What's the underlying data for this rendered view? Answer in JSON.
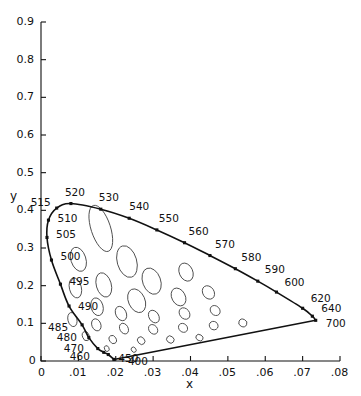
{
  "figure": {
    "title": "",
    "background_color": "#ffffff",
    "line_color": "#111111",
    "ellipse_color": "#444444"
  },
  "chart_data": {
    "type": "scatter",
    "title": "",
    "subtitle": "",
    "xlabel": "x",
    "ylabel": "y",
    "xlim": [
      0,
      0.08
    ],
    "ylim": [
      0,
      0.9
    ],
    "grid": false,
    "legend": null,
    "x_tick_values": [
      0,
      0.01,
      0.02,
      0.03,
      0.04,
      0.05,
      0.06,
      0.07,
      0.08
    ],
    "x_tick_labels": [
      "0",
      ".01",
      ".02",
      ".03",
      ".04",
      ".05",
      ".06",
      ".07",
      ".08"
    ],
    "y_tick_values": [
      0,
      0.1,
      0.2,
      0.3,
      0.4,
      0.5,
      0.6,
      0.7,
      0.8,
      0.9
    ],
    "y_tick_labels": [
      "0",
      "0.1",
      "0.2",
      "0.3",
      "0.4",
      "0.5",
      "0.6",
      "0.7",
      "0.8",
      "0.9"
    ],
    "annotations": [
      "MacAdam ellipses plotted on the spectral locus horseshoe",
      "Purple line closes the locus from 400 nm to 700 nm"
    ],
    "spectral_locus": {
      "name": "spectral locus",
      "marker": "filled-square",
      "points": [
        {
          "label": "400",
          "x": 0.0195,
          "y": 0.0042,
          "show_label": true,
          "label_dx": 14,
          "label_dy": 2
        },
        {
          "label": "450",
          "x": 0.018,
          "y": 0.0172,
          "show_label": true,
          "label_dx": 10,
          "label_dy": 3
        },
        {
          "label": "460",
          "x": 0.0168,
          "y": 0.023,
          "show_label": true,
          "label_dx": -34,
          "label_dy": 4
        },
        {
          "label": "470",
          "x": 0.0152,
          "y": 0.033,
          "show_label": true,
          "label_dx": -34,
          "label_dy": -1
        },
        {
          "label": "480",
          "x": 0.0128,
          "y": 0.062,
          "show_label": true,
          "label_dx": -32,
          "label_dy": -1
        },
        {
          "label": "485",
          "x": 0.011,
          "y": 0.096,
          "show_label": true,
          "label_dx": -34,
          "label_dy": 2
        },
        {
          "label": "490",
          "x": 0.0075,
          "y": 0.146,
          "show_label": true,
          "label_dx": 9,
          "label_dy": 0
        },
        {
          "label": "495",
          "x": 0.0052,
          "y": 0.204,
          "show_label": true,
          "label_dx": 9,
          "label_dy": -3
        },
        {
          "label": "500",
          "x": 0.0028,
          "y": 0.268,
          "show_label": true,
          "label_dx": 9,
          "label_dy": -4
        },
        {
          "label": "505",
          "x": 0.0016,
          "y": 0.328,
          "show_label": true,
          "label_dx": 9,
          "label_dy": -3
        },
        {
          "label": "510",
          "x": 0.002,
          "y": 0.374,
          "show_label": true,
          "label_dx": 9,
          "label_dy": -2
        },
        {
          "label": "515",
          "x": 0.0042,
          "y": 0.406,
          "show_label": true,
          "label_dx": -26,
          "label_dy": -6
        },
        {
          "label": "520",
          "x": 0.008,
          "y": 0.418,
          "show_label": true,
          "label_dx": -6,
          "label_dy": -12
        },
        {
          "label": "530",
          "x": 0.016,
          "y": 0.403,
          "show_label": true,
          "label_dx": -2,
          "label_dy": -12
        },
        {
          "label": "540",
          "x": 0.0236,
          "y": 0.379,
          "show_label": true,
          "label_dx": 0,
          "label_dy": -12
        },
        {
          "label": "550",
          "x": 0.031,
          "y": 0.348,
          "show_label": true,
          "label_dx": 2,
          "label_dy": -12
        },
        {
          "label": "560",
          "x": 0.0384,
          "y": 0.314,
          "show_label": true,
          "label_dx": 4,
          "label_dy": -12
        },
        {
          "label": "570",
          "x": 0.0452,
          "y": 0.28,
          "show_label": true,
          "label_dx": 5,
          "label_dy": -12
        },
        {
          "label": "580",
          "x": 0.052,
          "y": 0.245,
          "show_label": true,
          "label_dx": 6,
          "label_dy": -12
        },
        {
          "label": "590",
          "x": 0.058,
          "y": 0.212,
          "show_label": true,
          "label_dx": 7,
          "label_dy": -12
        },
        {
          "label": "600",
          "x": 0.063,
          "y": 0.183,
          "show_label": true,
          "label_dx": 8,
          "label_dy": -10
        },
        {
          "label": "620",
          "x": 0.07,
          "y": 0.14,
          "show_label": true,
          "label_dx": 8,
          "label_dy": -10
        },
        {
          "label": "640",
          "x": 0.0726,
          "y": 0.119,
          "show_label": true,
          "label_dx": 9,
          "label_dy": -8
        },
        {
          "label": "700",
          "x": 0.0735,
          "y": 0.108,
          "show_label": true,
          "label_dx": 10,
          "label_dy": 3
        }
      ]
    },
    "ellipses": [
      {
        "cx": 0.016,
        "cy": 0.352,
        "rx": 0.0026,
        "ry": 0.064,
        "angle": -18
      },
      {
        "cx": 0.01,
        "cy": 0.27,
        "rx": 0.002,
        "ry": 0.033,
        "angle": -18
      },
      {
        "cx": 0.023,
        "cy": 0.264,
        "rx": 0.0026,
        "ry": 0.043,
        "angle": -16
      },
      {
        "cx": 0.0168,
        "cy": 0.202,
        "rx": 0.002,
        "ry": 0.033,
        "angle": -16
      },
      {
        "cx": 0.0296,
        "cy": 0.212,
        "rx": 0.0024,
        "ry": 0.036,
        "angle": -20
      },
      {
        "cx": 0.0388,
        "cy": 0.236,
        "rx": 0.0018,
        "ry": 0.025,
        "angle": -24
      },
      {
        "cx": 0.0092,
        "cy": 0.194,
        "rx": 0.0016,
        "ry": 0.027,
        "angle": -14
      },
      {
        "cx": 0.0256,
        "cy": 0.16,
        "rx": 0.0022,
        "ry": 0.033,
        "angle": -24
      },
      {
        "cx": 0.0368,
        "cy": 0.17,
        "rx": 0.0018,
        "ry": 0.025,
        "angle": -28
      },
      {
        "cx": 0.0448,
        "cy": 0.182,
        "rx": 0.0015,
        "ry": 0.019,
        "angle": -34
      },
      {
        "cx": 0.015,
        "cy": 0.144,
        "rx": 0.0016,
        "ry": 0.024,
        "angle": -16
      },
      {
        "cx": 0.0214,
        "cy": 0.126,
        "rx": 0.0014,
        "ry": 0.02,
        "angle": -26
      },
      {
        "cx": 0.0302,
        "cy": 0.118,
        "rx": 0.0013,
        "ry": 0.018,
        "angle": -32
      },
      {
        "cx": 0.0384,
        "cy": 0.126,
        "rx": 0.0013,
        "ry": 0.0165,
        "angle": -38
      },
      {
        "cx": 0.0466,
        "cy": 0.134,
        "rx": 0.0012,
        "ry": 0.0145,
        "angle": -44
      },
      {
        "cx": 0.0084,
        "cy": 0.11,
        "rx": 0.0012,
        "ry": 0.019,
        "angle": -14
      },
      {
        "cx": 0.0148,
        "cy": 0.096,
        "rx": 0.0012,
        "ry": 0.0165,
        "angle": -22
      },
      {
        "cx": 0.0222,
        "cy": 0.086,
        "rx": 0.0011,
        "ry": 0.015,
        "angle": -30
      },
      {
        "cx": 0.03,
        "cy": 0.084,
        "rx": 0.0011,
        "ry": 0.014,
        "angle": -40
      },
      {
        "cx": 0.038,
        "cy": 0.088,
        "rx": 0.0011,
        "ry": 0.013,
        "angle": -48
      },
      {
        "cx": 0.0462,
        "cy": 0.094,
        "rx": 0.0011,
        "ry": 0.012,
        "angle": -56
      },
      {
        "cx": 0.054,
        "cy": 0.101,
        "rx": 0.001,
        "ry": 0.011,
        "angle": -64
      },
      {
        "cx": 0.012,
        "cy": 0.066,
        "rx": 0.0009,
        "ry": 0.0125,
        "angle": -20
      },
      {
        "cx": 0.0192,
        "cy": 0.057,
        "rx": 0.0009,
        "ry": 0.0115,
        "angle": -30
      },
      {
        "cx": 0.0268,
        "cy": 0.054,
        "rx": 0.0009,
        "ry": 0.011,
        "angle": -42
      },
      {
        "cx": 0.0346,
        "cy": 0.057,
        "rx": 0.0009,
        "ry": 0.0105,
        "angle": -52
      },
      {
        "cx": 0.0424,
        "cy": 0.062,
        "rx": 0.0008,
        "ry": 0.01,
        "angle": -60
      },
      {
        "cx": 0.0176,
        "cy": 0.033,
        "rx": 0.0006,
        "ry": 0.008,
        "angle": -26
      },
      {
        "cx": 0.0248,
        "cy": 0.03,
        "rx": 0.0006,
        "ry": 0.0075,
        "angle": -40
      }
    ]
  },
  "axes": {
    "x_axis_name": "x-axis",
    "y_axis_name": "y-axis",
    "x_title": "x",
    "y_title": "y"
  }
}
